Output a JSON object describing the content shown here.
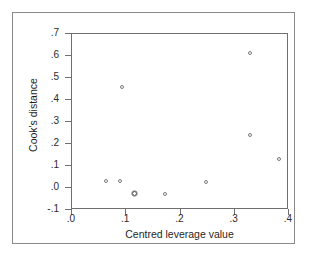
{
  "chart_data": {
    "type": "scatter",
    "title": "",
    "xlabel": "Centred leverage value",
    "ylabel": "Cook's distance",
    "xlim": [
      0.0,
      0.4
    ],
    "ylim": [
      -0.1,
      0.7
    ],
    "grid": false,
    "legend": null,
    "xticks": [
      ".0",
      ".1",
      ".2",
      ".3",
      ".4"
    ],
    "xtick_values": [
      0.0,
      0.1,
      0.2,
      0.3,
      0.4
    ],
    "yticks": [
      "-.1",
      ".0",
      ".1",
      ".2",
      ".3",
      ".4",
      ".5",
      ".6",
      ".7"
    ],
    "ytick_values": [
      -0.1,
      0.0,
      0.1,
      0.2,
      0.3,
      0.4,
      0.5,
      0.6,
      0.7
    ],
    "marker": "open-circle",
    "marker_color": "#7b7b7b",
    "points": [
      {
        "x": 0.063,
        "y": 0.032,
        "style": "open"
      },
      {
        "x": 0.089,
        "y": 0.031,
        "style": "open"
      },
      {
        "x": 0.092,
        "y": 0.458,
        "style": "open"
      },
      {
        "x": 0.116,
        "y": -0.023,
        "style": "dark"
      },
      {
        "x": 0.172,
        "y": -0.027,
        "style": "open"
      },
      {
        "x": 0.247,
        "y": 0.027,
        "style": "open"
      },
      {
        "x": 0.328,
        "y": 0.612,
        "style": "open"
      },
      {
        "x": 0.328,
        "y": 0.239,
        "style": "open"
      },
      {
        "x": 0.381,
        "y": 0.13,
        "style": "open"
      }
    ]
  },
  "figure": {
    "background": "#ffffff",
    "frame_color": "#6f6f6f",
    "outer_border_color": "#8a8a8a",
    "text_color": "#1f1f1f"
  }
}
